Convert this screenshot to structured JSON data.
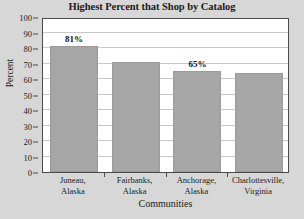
{
  "chart_data": {
    "type": "bar",
    "title": "Highest Percent that Shop by Catalog",
    "xlabel": "Communities",
    "ylabel": "Percent",
    "categories": [
      "Juneau, Alaska",
      "Fairbanks, Alaska",
      "Anchorage, Alaska",
      "Charlottesville, Virginia"
    ],
    "category_lines": [
      [
        "Juneau,",
        "Alaska"
      ],
      [
        "Fairbanks,",
        "Alaska"
      ],
      [
        "Anchorage,",
        "Alaska"
      ],
      [
        "Charlottesville,",
        "Virginia"
      ]
    ],
    "values": [
      81,
      71,
      65,
      64
    ],
    "data_labels": [
      "81%",
      "",
      "65%",
      ""
    ],
    "ylim": [
      0,
      100
    ],
    "ytick_step": 10,
    "yticks": [
      0,
      10,
      20,
      30,
      40,
      50,
      60,
      70,
      80,
      90,
      100
    ],
    "ytick_labels": [
      "0",
      "10",
      "20",
      "30",
      "40",
      "50",
      "60",
      "70",
      "80",
      "90",
      "100"
    ],
    "grid": true,
    "legend": false,
    "bar_color": "#a6a6a6",
    "plot_background": "#ffffff",
    "figure_background": "#d7d7d7",
    "axis_color": "#4a4a4a",
    "gridline_color": "#c9c9c9"
  }
}
